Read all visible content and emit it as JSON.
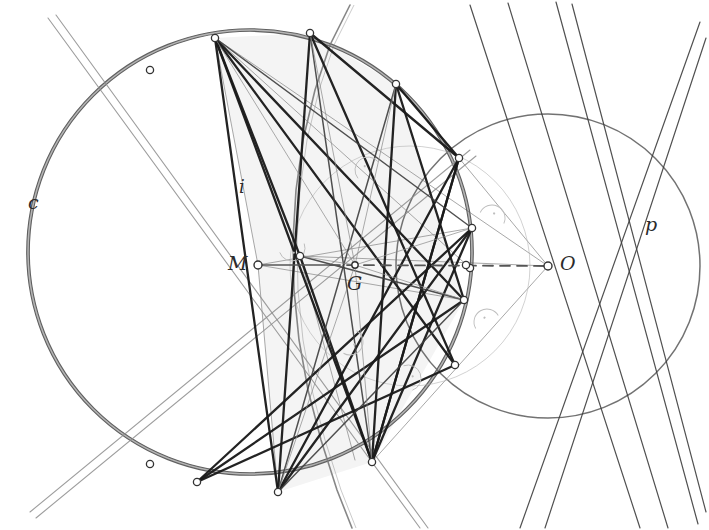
{
  "figure": {
    "kind": "euclidean-construction",
    "width": 709,
    "height": 530,
    "background": "#ffffff"
  },
  "colors": {
    "circle_stroke": "#5a5a5a",
    "chord_dark": "#1a1a1a",
    "chord_mid": "#3d3d3d",
    "thin_gray": "#8c8c8c",
    "very_light": "#bdbdbd",
    "shade_fill": "#f2f2f2",
    "label_color": "#2b2b2b",
    "node_fill": "#ffffff",
    "node_stroke": "#333333",
    "axis_dash": "#555555"
  },
  "labels": [
    {
      "name": "label-c",
      "text": "c",
      "x": 28,
      "y": 193,
      "size": 19
    },
    {
      "name": "label-i",
      "text": "i",
      "x": 239,
      "y": 178,
      "size": 18
    },
    {
      "name": "label-M",
      "text": "M",
      "x": 228,
      "y": 254,
      "size": 19
    },
    {
      "name": "label-G",
      "text": "G",
      "x": 347,
      "y": 274,
      "size": 19
    },
    {
      "name": "label-O",
      "text": "O",
      "x": 560,
      "y": 254,
      "size": 19
    },
    {
      "name": "label-p",
      "text": "p",
      "x": 645,
      "y": 215,
      "size": 19
    }
  ],
  "circles": [
    {
      "name": "circle-c",
      "cx": 250,
      "cy": 252,
      "r": 222,
      "stroke": "#5a5a5a",
      "width": 2.6,
      "double": true
    },
    {
      "name": "circle-p",
      "cx": 548,
      "cy": 266,
      "r": 152,
      "stroke": "#6a6a6a",
      "width": 1.5,
      "double": false
    },
    {
      "name": "circle-aux-small",
      "cx": 410,
      "cy": 266,
      "r": 120,
      "stroke": "#adadad",
      "width": 1.0,
      "double": false
    }
  ],
  "centers": [
    {
      "name": "point-M",
      "x": 258,
      "y": 265,
      "r": 4.0
    },
    {
      "name": "point-G",
      "x": 355,
      "y": 265,
      "r": 3.2
    },
    {
      "name": "point-O",
      "x": 548,
      "y": 266,
      "r": 4.0
    }
  ],
  "axis": {
    "name": "axis-MO",
    "x1": 258,
    "y1": 265,
    "x2": 548,
    "y2": 266,
    "solid_left_to": 330,
    "dash": "10,7"
  },
  "vertices": [
    {
      "name": "vertex-A",
      "x": 215,
      "y": 38
    },
    {
      "name": "vertex-B",
      "x": 310,
      "y": 33
    },
    {
      "name": "vertex-C",
      "x": 396,
      "y": 84
    },
    {
      "name": "vertex-D",
      "x": 459,
      "y": 158
    },
    {
      "name": "vertex-E",
      "x": 472,
      "y": 228
    },
    {
      "name": "vertex-F",
      "x": 470,
      "y": 268
    },
    {
      "name": "vertex-H",
      "x": 464,
      "y": 300
    },
    {
      "name": "vertex-I",
      "x": 455,
      "y": 365
    },
    {
      "name": "vertex-J",
      "x": 372,
      "y": 462
    },
    {
      "name": "vertex-K",
      "x": 278,
      "y": 492
    },
    {
      "name": "vertex-L",
      "x": 197,
      "y": 482
    },
    {
      "name": "vertex-N",
      "x": 150,
      "y": 70
    },
    {
      "name": "vertex-P",
      "x": 150,
      "y": 464
    },
    {
      "name": "vertex-Q",
      "x": 300,
      "y": 256
    },
    {
      "name": "vertex-R",
      "x": 466,
      "y": 265
    }
  ],
  "chords_heavy": [
    {
      "name": "chord-A-J",
      "x1": 215,
      "y1": 38,
      "x2": 372,
      "y2": 462
    },
    {
      "name": "chord-A-K",
      "x1": 215,
      "y1": 38,
      "x2": 278,
      "y2": 492
    },
    {
      "name": "chord-A-I",
      "x1": 215,
      "y1": 38,
      "x2": 455,
      "y2": 365
    },
    {
      "name": "chord-A-H",
      "x1": 215,
      "y1": 38,
      "x2": 464,
      "y2": 300
    },
    {
      "name": "chord-B-K",
      "x1": 310,
      "y1": 33,
      "x2": 278,
      "y2": 492
    },
    {
      "name": "chord-B-I",
      "x1": 310,
      "y1": 33,
      "x2": 455,
      "y2": 365
    },
    {
      "name": "chord-B-D",
      "x1": 310,
      "y1": 33,
      "x2": 459,
      "y2": 158
    },
    {
      "name": "chord-C-J",
      "x1": 396,
      "y1": 84,
      "x2": 372,
      "y2": 462
    },
    {
      "name": "chord-C-D",
      "x1": 396,
      "y1": 84,
      "x2": 459,
      "y2": 158
    },
    {
      "name": "chord-C-H",
      "x1": 396,
      "y1": 84,
      "x2": 464,
      "y2": 300
    },
    {
      "name": "chord-D-J",
      "x1": 459,
      "y1": 158,
      "x2": 372,
      "y2": 462
    },
    {
      "name": "chord-D-K",
      "x1": 459,
      "y1": 158,
      "x2": 278,
      "y2": 492
    },
    {
      "name": "chord-E-J",
      "x1": 472,
      "y1": 228,
      "x2": 372,
      "y2": 462
    },
    {
      "name": "chord-E-L",
      "x1": 472,
      "y1": 228,
      "x2": 197,
      "y2": 482
    },
    {
      "name": "chord-H-L",
      "x1": 464,
      "y1": 300,
      "x2": 197,
      "y2": 482
    },
    {
      "name": "chord-I-L",
      "x1": 455,
      "y1": 365,
      "x2": 197,
      "y2": 482
    },
    {
      "name": "chord-A-Q",
      "x1": 215,
      "y1": 38,
      "x2": 300,
      "y2": 256
    },
    {
      "name": "chord-Q-J",
      "x1": 300,
      "y1": 256,
      "x2": 372,
      "y2": 462
    },
    {
      "name": "chord-K-E",
      "x1": 278,
      "y1": 492,
      "x2": 472,
      "y2": 228
    },
    {
      "name": "chord-J-D2",
      "x1": 372,
      "y1": 462,
      "x2": 459,
      "y2": 158
    }
  ],
  "chords_mid": [
    {
      "name": "chord-B-J",
      "x1": 310,
      "y1": 33,
      "x2": 372,
      "y2": 462
    },
    {
      "name": "chord-C-K",
      "x1": 396,
      "y1": 84,
      "x2": 278,
      "y2": 492
    },
    {
      "name": "chord-A-E",
      "x1": 215,
      "y1": 38,
      "x2": 472,
      "y2": 228
    },
    {
      "name": "chord-Q-H",
      "x1": 300,
      "y1": 256,
      "x2": 464,
      "y2": 300
    },
    {
      "name": "chord-K-H",
      "x1": 278,
      "y1": 492,
      "x2": 464,
      "y2": 300
    }
  ],
  "rays_from_G": [
    {
      "name": "ray-G-A",
      "x2": 215,
      "y2": 38
    },
    {
      "name": "ray-G-B",
      "x2": 310,
      "y2": 33
    },
    {
      "name": "ray-G-C",
      "x2": 396,
      "y2": 84
    },
    {
      "name": "ray-G-E",
      "x2": 472,
      "y2": 228
    },
    {
      "name": "ray-G-H",
      "x2": 464,
      "y2": 300
    },
    {
      "name": "ray-G-J",
      "x2": 372,
      "y2": 462
    },
    {
      "name": "ray-G-K",
      "x2": 278,
      "y2": 492
    },
    {
      "name": "ray-G-Q",
      "x2": 300,
      "y2": 256
    }
  ],
  "thin_lines": [
    {
      "name": "thin-A-O",
      "x1": 215,
      "y1": 38,
      "x2": 548,
      "y2": 266
    },
    {
      "name": "thin-M-A",
      "x1": 258,
      "y1": 265,
      "x2": 215,
      "y2": 38
    },
    {
      "name": "thin-M-E",
      "x1": 258,
      "y1": 265,
      "x2": 472,
      "y2": 228
    },
    {
      "name": "thin-M-H",
      "x1": 258,
      "y1": 265,
      "x2": 464,
      "y2": 300
    },
    {
      "name": "thin-M-K",
      "x1": 258,
      "y1": 265,
      "x2": 278,
      "y2": 492
    },
    {
      "name": "thin-O-Q",
      "x1": 548,
      "y1": 266,
      "x2": 300,
      "y2": 256
    },
    {
      "name": "thin-O-J",
      "x1": 548,
      "y1": 266,
      "x2": 372,
      "y2": 462
    },
    {
      "name": "thin-O-D",
      "x1": 548,
      "y1": 266,
      "x2": 459,
      "y2": 158
    },
    {
      "name": "thin-A-F",
      "x1": 215,
      "y1": 38,
      "x2": 470,
      "y2": 268
    },
    {
      "name": "thin-K-D",
      "x1": 278,
      "y1": 492,
      "x2": 459,
      "y2": 158
    },
    {
      "name": "thin-Q-J2",
      "x1": 300,
      "y1": 256,
      "x2": 355,
      "y2": 460
    }
  ],
  "tangent_pencil": [
    {
      "name": "tangent-1",
      "x1": 470,
      "y1": 5,
      "x2": 640,
      "y2": 528
    },
    {
      "name": "tangent-2",
      "x1": 508,
      "y1": 3,
      "x2": 668,
      "y2": 528
    },
    {
      "name": "tangent-3",
      "x1": 556,
      "y1": 2,
      "x2": 698,
      "y2": 524
    },
    {
      "name": "tangent-4",
      "x1": 572,
      "y1": 4,
      "x2": 706,
      "y2": 512
    },
    {
      "name": "tangent-5",
      "x1": 700,
      "y1": 22,
      "x2": 520,
      "y2": 528
    },
    {
      "name": "tangent-6",
      "x1": 706,
      "y1": 38,
      "x2": 545,
      "y2": 528
    }
  ],
  "secants": [
    {
      "name": "secant-upper-left",
      "x1": 48,
      "y1": 18,
      "x2": 420,
      "y2": 528
    },
    {
      "name": "secant-upper-left-2",
      "x1": 56,
      "y1": 15,
      "x2": 428,
      "y2": 528
    },
    {
      "name": "secant-lower-left",
      "x1": 30,
      "y1": 512,
      "x2": 470,
      "y2": 150
    },
    {
      "name": "secant-lower-left-2",
      "x1": 36,
      "y1": 518,
      "x2": 476,
      "y2": 156
    }
  ],
  "hyperbola": {
    "name": "hyperbola-branch",
    "stroke": "#7a7a7a",
    "width": 1.6,
    "points": [
      [
        350,
        5
      ],
      [
        330,
        45
      ],
      [
        315,
        90
      ],
      [
        303,
        140
      ],
      [
        296,
        190
      ],
      [
        293,
        240
      ],
      [
        294,
        290
      ],
      [
        299,
        340
      ],
      [
        308,
        390
      ],
      [
        321,
        440
      ],
      [
        337,
        490
      ],
      [
        352,
        528
      ]
    ]
  },
  "shaded_polygon": {
    "name": "shaded-region",
    "fill": "#f4f4f4",
    "points": [
      [
        310,
        33
      ],
      [
        396,
        84
      ],
      [
        464,
        300
      ],
      [
        372,
        462
      ],
      [
        278,
        492
      ],
      [
        258,
        265
      ],
      [
        215,
        38
      ]
    ]
  },
  "right_angle_marks": [
    {
      "name": "right-angle-mark-1",
      "x": 368,
      "y": 170,
      "rot": -40
    },
    {
      "name": "right-angle-mark-2",
      "x": 292,
      "y": 248,
      "rot": 160
    },
    {
      "name": "right-angle-mark-3",
      "x": 492,
      "y": 218,
      "rot": 25
    },
    {
      "name": "right-angle-mark-4",
      "x": 487,
      "y": 322,
      "rot": -30
    },
    {
      "name": "right-angle-mark-5",
      "x": 350,
      "y": 342,
      "rot": 120
    },
    {
      "name": "right-angle-mark-6",
      "x": 408,
      "y": 378,
      "rot": 70
    }
  ]
}
